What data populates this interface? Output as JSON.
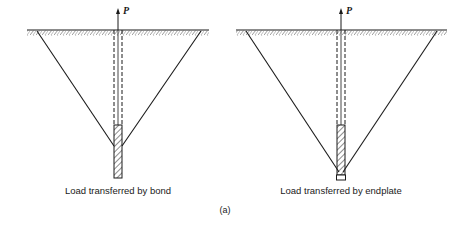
{
  "figure": {
    "label": "(a)",
    "panels": [
      {
        "id": "bond",
        "caption": "Load transferred by bond",
        "load_label": "P",
        "mechanism": "bond"
      },
      {
        "id": "endplate",
        "caption": "Load transferred by endplate",
        "load_label": "P",
        "mechanism": "endplate"
      }
    ]
  },
  "colors": {
    "line": "#1a1a1a",
    "background": "#ffffff"
  }
}
